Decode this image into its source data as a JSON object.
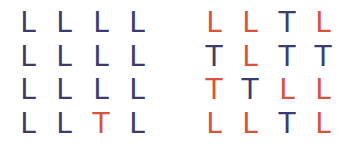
{
  "colors": {
    "navy": "#3b3b70",
    "red": "#d9533b"
  },
  "grids": [
    {
      "name": "left-grid",
      "rows": [
        [
          {
            "ch": "L",
            "c": "navy"
          },
          {
            "ch": "L",
            "c": "navy"
          },
          {
            "ch": "L",
            "c": "navy"
          },
          {
            "ch": "L",
            "c": "navy"
          }
        ],
        [
          {
            "ch": "L",
            "c": "navy"
          },
          {
            "ch": "L",
            "c": "navy"
          },
          {
            "ch": "L",
            "c": "navy"
          },
          {
            "ch": "L",
            "c": "navy"
          }
        ],
        [
          {
            "ch": "L",
            "c": "navy"
          },
          {
            "ch": "L",
            "c": "navy"
          },
          {
            "ch": "L",
            "c": "navy"
          },
          {
            "ch": "L",
            "c": "navy"
          }
        ],
        [
          {
            "ch": "L",
            "c": "navy"
          },
          {
            "ch": "L",
            "c": "navy"
          },
          {
            "ch": "T",
            "c": "red"
          },
          {
            "ch": "L",
            "c": "navy"
          }
        ]
      ]
    },
    {
      "name": "right-grid",
      "rows": [
        [
          {
            "ch": "L",
            "c": "red"
          },
          {
            "ch": "L",
            "c": "red"
          },
          {
            "ch": "T",
            "c": "navy"
          },
          {
            "ch": "L",
            "c": "red"
          }
        ],
        [
          {
            "ch": "T",
            "c": "navy"
          },
          {
            "ch": "L",
            "c": "red"
          },
          {
            "ch": "T",
            "c": "navy"
          },
          {
            "ch": "T",
            "c": "navy"
          }
        ],
        [
          {
            "ch": "T",
            "c": "red"
          },
          {
            "ch": "T",
            "c": "navy"
          },
          {
            "ch": "L",
            "c": "red"
          },
          {
            "ch": "L",
            "c": "red"
          }
        ],
        [
          {
            "ch": "L",
            "c": "red"
          },
          {
            "ch": "L",
            "c": "red"
          },
          {
            "ch": "T",
            "c": "navy"
          },
          {
            "ch": "L",
            "c": "red"
          }
        ]
      ]
    }
  ]
}
